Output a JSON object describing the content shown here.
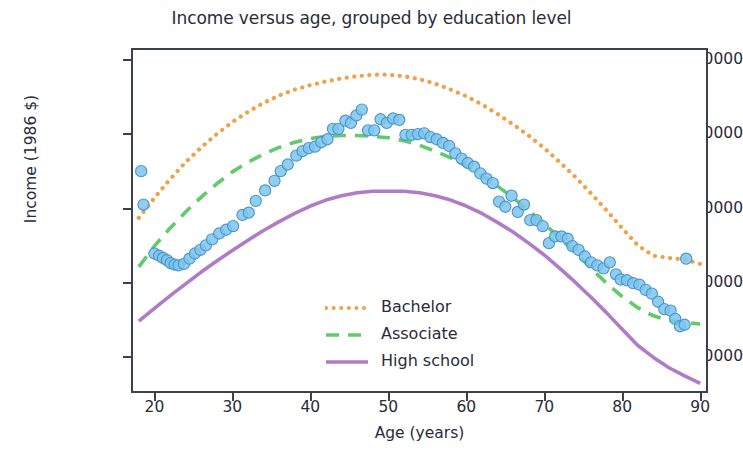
{
  "chart_data": {
    "type": "scatter",
    "title": "Income versus age, grouped by education level",
    "xlabel": "Age (years)",
    "ylabel": "Income (1986 $)",
    "xlim": [
      17,
      91
    ],
    "ylim": [
      5000,
      51500
    ],
    "xticks": [
      20,
      30,
      40,
      50,
      60,
      70,
      80,
      90
    ],
    "yticks": [
      10000,
      20000,
      30000,
      40000,
      50000
    ],
    "grid": false,
    "legend_position": "lower center",
    "legend": [
      "Bachelor",
      "Associate",
      "High school"
    ],
    "series": [
      {
        "name": "Bachelor",
        "type": "line",
        "style": "dotted",
        "color": "#f0a14b",
        "x": [
          18,
          20,
          22,
          24,
          26,
          28,
          30,
          32,
          34,
          36,
          38,
          40,
          42,
          44,
          46,
          48,
          50,
          52,
          54,
          56,
          58,
          60,
          62,
          64,
          66,
          68,
          70,
          72,
          74,
          76,
          78,
          80,
          82,
          84,
          86,
          88,
          90
        ],
        "y": [
          28600,
          31300,
          33800,
          36100,
          38100,
          39900,
          41500,
          42900,
          44100,
          45100,
          45900,
          46500,
          47000,
          47400,
          47700,
          47900,
          47900,
          47700,
          47300,
          46700,
          45900,
          45000,
          43900,
          42600,
          41200,
          39700,
          38000,
          36100,
          34100,
          31900,
          29600,
          27200,
          24900,
          23500,
          23200,
          23000,
          22400
        ]
      },
      {
        "name": "Associate",
        "type": "line",
        "style": "dashed",
        "color": "#63c96d",
        "x": [
          18,
          20,
          22,
          24,
          26,
          28,
          30,
          32,
          34,
          36,
          38,
          40,
          42,
          44,
          46,
          48,
          50,
          52,
          54,
          56,
          58,
          60,
          62,
          64,
          66,
          68,
          70,
          72,
          74,
          76,
          78,
          80,
          82,
          84,
          86,
          88,
          90
        ],
        "y": [
          22000,
          24800,
          27200,
          29400,
          31400,
          33200,
          34800,
          36100,
          37200,
          38100,
          38800,
          39300,
          39600,
          39700,
          39700,
          39600,
          39400,
          39000,
          38400,
          37600,
          36700,
          35600,
          34300,
          32900,
          31300,
          29600,
          27800,
          25900,
          23900,
          21800,
          19800,
          18000,
          16500,
          15400,
          14800,
          14500,
          14300
        ]
      },
      {
        "name": "High school",
        "type": "line",
        "style": "solid",
        "color": "#b07cc6",
        "x": [
          18,
          20,
          22,
          24,
          26,
          28,
          30,
          32,
          34,
          36,
          38,
          40,
          42,
          44,
          46,
          48,
          50,
          52,
          54,
          56,
          58,
          60,
          62,
          64,
          66,
          68,
          70,
          72,
          74,
          76,
          78,
          80,
          82,
          84,
          86,
          88,
          90
        ],
        "y": [
          14700,
          16400,
          18100,
          19700,
          21300,
          22800,
          24200,
          25600,
          26900,
          28100,
          29200,
          30200,
          31000,
          31600,
          32000,
          32200,
          32200,
          32200,
          32000,
          31600,
          31000,
          30200,
          29200,
          28000,
          26700,
          25200,
          23600,
          21800,
          19900,
          17900,
          15800,
          13600,
          11400,
          9800,
          8400,
          7300,
          6300
        ]
      },
      {
        "name": "observations",
        "type": "scatter",
        "color": "#7cc5ee",
        "edge_color": "#4a94c9",
        "points": [
          [
            18.3,
            34900
          ],
          [
            18.6,
            30400
          ],
          [
            20.0,
            23800
          ],
          [
            20.6,
            23500
          ],
          [
            21.1,
            23200
          ],
          [
            21.6,
            22900
          ],
          [
            22.1,
            22500
          ],
          [
            22.6,
            22300
          ],
          [
            23.1,
            22200
          ],
          [
            23.8,
            22400
          ],
          [
            24.5,
            23100
          ],
          [
            25.2,
            23800
          ],
          [
            25.9,
            24300
          ],
          [
            26.6,
            24900
          ],
          [
            27.4,
            25700
          ],
          [
            28.3,
            26500
          ],
          [
            29.2,
            27000
          ],
          [
            30.1,
            27500
          ],
          [
            31.3,
            29000
          ],
          [
            32.1,
            29300
          ],
          [
            33.0,
            30900
          ],
          [
            34.2,
            32300
          ],
          [
            35.4,
            33600
          ],
          [
            36.2,
            34900
          ],
          [
            37.1,
            35800
          ],
          [
            38.2,
            37000
          ],
          [
            39.0,
            37600
          ],
          [
            39.8,
            38000
          ],
          [
            40.6,
            38200
          ],
          [
            41.4,
            38800
          ],
          [
            42.2,
            39200
          ],
          [
            42.9,
            40600
          ],
          [
            43.6,
            40600
          ],
          [
            44.5,
            41700
          ],
          [
            45.2,
            41400
          ],
          [
            45.9,
            42400
          ],
          [
            46.6,
            43200
          ],
          [
            47.4,
            40400
          ],
          [
            48.2,
            40400
          ],
          [
            49.0,
            41900
          ],
          [
            49.8,
            41400
          ],
          [
            50.6,
            42000
          ],
          [
            51.4,
            41800
          ],
          [
            52.2,
            39800
          ],
          [
            53.0,
            39800
          ],
          [
            53.8,
            39900
          ],
          [
            54.6,
            40000
          ],
          [
            55.4,
            39500
          ],
          [
            56.2,
            39200
          ],
          [
            57.0,
            38700
          ],
          [
            57.8,
            38300
          ],
          [
            58.6,
            37300
          ],
          [
            59.4,
            36600
          ],
          [
            60.2,
            36000
          ],
          [
            61.0,
            35500
          ],
          [
            61.8,
            34600
          ],
          [
            62.6,
            33900
          ],
          [
            63.4,
            33300
          ],
          [
            64.2,
            30800
          ],
          [
            65.0,
            30100
          ],
          [
            65.8,
            31600
          ],
          [
            66.6,
            29400
          ],
          [
            67.4,
            30400
          ],
          [
            68.2,
            28300
          ],
          [
            69.0,
            28300
          ],
          [
            69.8,
            27500
          ],
          [
            70.6,
            25200
          ],
          [
            71.4,
            26100
          ],
          [
            72.2,
            26100
          ],
          [
            73.0,
            25800
          ],
          [
            73.6,
            24800
          ],
          [
            74.4,
            24300
          ],
          [
            75.2,
            23400
          ],
          [
            76.0,
            22600
          ],
          [
            76.8,
            22200
          ],
          [
            77.6,
            21800
          ],
          [
            78.4,
            22600
          ],
          [
            79.2,
            21000
          ],
          [
            79.8,
            20300
          ],
          [
            80.6,
            20200
          ],
          [
            81.4,
            19800
          ],
          [
            82.2,
            19600
          ],
          [
            83.0,
            18900
          ],
          [
            83.8,
            18400
          ],
          [
            84.6,
            17300
          ],
          [
            85.4,
            16300
          ],
          [
            86.2,
            16100
          ],
          [
            86.8,
            15000
          ],
          [
            87.4,
            14000
          ],
          [
            88.0,
            14200
          ],
          [
            88.2,
            23100
          ]
        ]
      }
    ]
  },
  "axes": {
    "ytick_labels": [
      "50000",
      "40000",
      "30000",
      "20000",
      "10000"
    ],
    "xtick_labels": [
      "20",
      "30",
      "40",
      "50",
      "60",
      "70",
      "80",
      "90"
    ]
  },
  "legend": {
    "items": [
      {
        "label": "Bachelor"
      },
      {
        "label": "Associate"
      },
      {
        "label": "High school"
      }
    ]
  },
  "colors": {
    "bachelor": "#f0a14b",
    "associate": "#63c96d",
    "high_school": "#b07cc6",
    "scatter_face": "#7cc5ee",
    "scatter_edge": "#4a94c9",
    "axis": "#3a3f52",
    "text": "#2b2b38"
  }
}
